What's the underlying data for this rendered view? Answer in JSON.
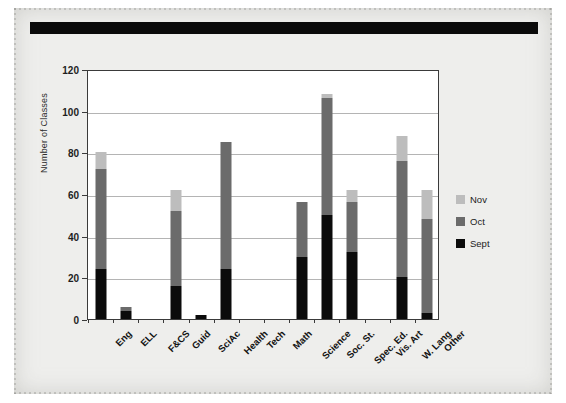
{
  "chart_data": {
    "type": "bar",
    "subtype": "stacked-column",
    "title": "",
    "xlabel": "",
    "ylabel": "Number of Classes",
    "ylim": [
      0,
      120
    ],
    "yticks": [
      0,
      20,
      40,
      60,
      80,
      100,
      120
    ],
    "grid": true,
    "legend_position": "right",
    "categories": [
      "Eng",
      "ELL",
      "F&CS",
      "Guid",
      "SciAc",
      "Health",
      "Tech",
      "Math",
      "Science",
      "Soc. St.",
      "Spec. Ed.",
      "Vis. Art",
      "W. Lang",
      "Other"
    ],
    "series": [
      {
        "name": "Sept",
        "color": "#0b0b0b",
        "values": [
          24,
          4,
          0,
          16,
          2,
          24,
          0,
          0,
          30,
          50,
          32,
          0,
          20,
          3
        ]
      },
      {
        "name": "Oct",
        "color": "#6b6b6b",
        "values": [
          48,
          2,
          0,
          36,
          0,
          61,
          0,
          0,
          26,
          56,
          24,
          0,
          56,
          45
        ]
      },
      {
        "name": "Nov",
        "color": "#bdbdbd",
        "values": [
          8,
          0,
          0,
          10,
          0,
          0,
          0,
          0,
          0,
          2,
          6,
          0,
          12,
          14
        ]
      }
    ],
    "totals": [
      80,
      6,
      0,
      62,
      2,
      85,
      0,
      0,
      56,
      108,
      62,
      0,
      88,
      62
    ]
  },
  "legend": {
    "entries": [
      {
        "label": "Nov",
        "color": "#bdbdbd"
      },
      {
        "label": "Oct",
        "color": "#6b6b6b"
      },
      {
        "label": "Sept",
        "color": "#0b0b0b"
      }
    ]
  },
  "axis": {
    "y_title": "Number of Classes",
    "y_tick_labels": [
      "120",
      "100",
      "80",
      "60",
      "40",
      "20",
      "0"
    ]
  },
  "colors": {
    "page_background": "#eeeeec",
    "plot_background": "#ffffff",
    "axis_line": "#3a3a3a",
    "gridline": "#b4b4b4",
    "artifact_bar": "#0a0a0a"
  }
}
